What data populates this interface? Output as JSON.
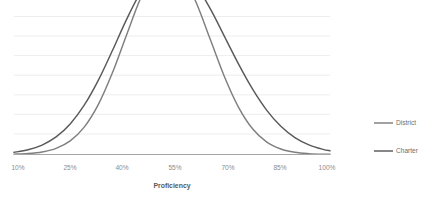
{
  "chart_data": {
    "type": "line",
    "title": "",
    "xlabel": "Proficiency",
    "ylabel": "",
    "grid": true,
    "legend_position": "right",
    "xlim": [
      10,
      100
    ],
    "ylim": [
      0,
      0.07
    ],
    "xticks": [
      10,
      25,
      40,
      55,
      70,
      85,
      100
    ],
    "xtick_labels": [
      "10%",
      "25%",
      "40%",
      "55%",
      "70%",
      "85%",
      "100%"
    ],
    "ytick_labels": [],
    "gridline_count": 8,
    "colors": {
      "district": "#7f7f7f",
      "charter": "#595959",
      "gridline": "#e9e9e9",
      "axis": "#a6a6a6",
      "tick_text": "#8c8c8c",
      "axis_title_text": "#595959",
      "legend_text": "#6e6e6e"
    },
    "x": [
      10,
      14,
      18,
      22,
      26,
      30,
      34,
      38,
      42,
      46,
      50,
      54,
      58,
      62,
      66,
      70,
      74,
      78,
      82,
      86,
      90,
      94,
      98,
      100
    ],
    "series": [
      {
        "name": "District",
        "peak_x": 62,
        "values": [
          0.0002,
          0.0005,
          0.0013,
          0.0031,
          0.0069,
          0.0139,
          0.0253,
          0.0413,
          0.0604,
          0.079,
          0.0924,
          0.0967,
          0.0909,
          0.0766,
          0.0579,
          0.0392,
          0.0238,
          0.0129,
          0.0063,
          0.0028,
          0.0011,
          0.0004,
          0.0001,
          0.0001
        ]
      },
      {
        "name": "Charter",
        "peak_x": 72,
        "values": [
          0.0011,
          0.0024,
          0.0048,
          0.0089,
          0.0155,
          0.025,
          0.0376,
          0.0526,
          0.0683,
          0.0821,
          0.0917,
          0.0955,
          0.0932,
          0.0854,
          0.0736,
          0.0597,
          0.0457,
          0.033,
          0.0224,
          0.0143,
          0.0086,
          0.0049,
          0.0026,
          0.0019
        ]
      }
    ]
  },
  "legend": {
    "items": [
      {
        "label": "District",
        "swatch": "#7f7f7f"
      },
      {
        "label": "Charter",
        "swatch": "#595959"
      }
    ]
  },
  "axis": {
    "x_title": "Proficiency",
    "ticks": [
      "10%",
      "25%",
      "40%",
      "55%",
      "70%",
      "85%",
      "100%"
    ]
  }
}
